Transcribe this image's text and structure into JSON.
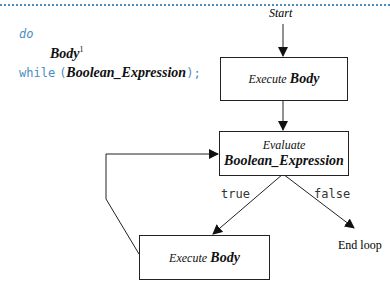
{
  "code": {
    "keyword_do": "do",
    "body": "Body",
    "footnote": "1",
    "keyword_while": "while",
    "open_paren": "(",
    "condition": "Boolean_Expression",
    "close": ");"
  },
  "flowchart": {
    "start": "Start",
    "execute_body_top": {
      "verb": "Execute",
      "noun": "Body"
    },
    "evaluate": {
      "verb": "Evaluate",
      "noun": "Boolean_Expression"
    },
    "execute_body_bottom": {
      "verb": "Execute",
      "noun": "Body"
    },
    "true_label": "true",
    "false_label": "false",
    "end": "End loop"
  },
  "colors": {
    "code_blue": "#4a8ec0",
    "line": "#222222"
  }
}
